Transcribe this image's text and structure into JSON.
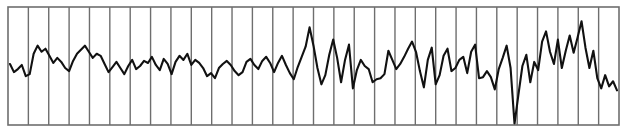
{
  "chart_data": {
    "type": "line",
    "title": "",
    "xlabel": "",
    "ylabel": "",
    "grid": {
      "vertical": true,
      "horizontal": false,
      "divisions": 30
    },
    "legend": null,
    "xlim": [
      0,
      150
    ],
    "ylim": [
      -58,
      58
    ],
    "series": [
      {
        "name": "signal",
        "color": "#111111",
        "x_step": 1,
        "values": [
          2,
          -6,
          -3,
          1,
          -10,
          -8,
          12,
          20,
          14,
          17,
          10,
          3,
          8,
          4,
          -2,
          -5,
          5,
          12,
          16,
          20,
          14,
          8,
          12,
          10,
          2,
          -6,
          -1,
          4,
          -2,
          -8,
          0,
          6,
          -3,
          0,
          5,
          3,
          9,
          1,
          -4,
          7,
          2,
          -8,
          4,
          10,
          6,
          12,
          1,
          6,
          3,
          -2,
          -10,
          -7,
          -12,
          -2,
          2,
          5,
          1,
          -5,
          -9,
          -6,
          4,
          7,
          1,
          -3,
          5,
          9,
          3,
          -6,
          3,
          10,
          1,
          -7,
          -13,
          -1,
          9,
          19,
          38,
          20,
          -2,
          -18,
          -9,
          11,
          26,
          8,
          -16,
          6,
          21,
          -22,
          -4,
          6,
          0,
          -3,
          -16,
          -13,
          -12,
          -8,
          15,
          6,
          -3,
          2,
          9,
          17,
          24,
          14,
          -5,
          -21,
          6,
          18,
          -18,
          -9,
          10,
          17,
          -5,
          -2,
          6,
          9,
          -7,
          14,
          21,
          -12,
          -11,
          -5,
          -11,
          -23,
          -3,
          8,
          20,
          -2,
          -57,
          -28,
          0,
          11,
          -16,
          4,
          -4,
          24,
          34,
          14,
          2,
          26,
          -2,
          15,
          30,
          13,
          28,
          44,
          18,
          -2,
          15,
          -12,
          -22,
          -9,
          -20,
          -15,
          -24
        ]
      }
    ],
    "layout": {
      "plot_left": 8,
      "plot_top": 7,
      "plot_right": 619,
      "plot_bottom": 125,
      "frame_color": "#6e6e6e",
      "grid_color": "#6e6e6e",
      "background": "#ffffff"
    }
  }
}
